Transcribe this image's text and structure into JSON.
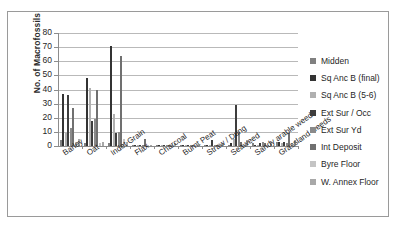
{
  "chart_data": {
    "type": "bar",
    "title": "",
    "xlabel": "",
    "ylabel": "No. of Macrofossils",
    "ylim": [
      0,
      80
    ],
    "ytick_step": 10,
    "yticks": [
      "80",
      "70",
      "60",
      "50",
      "40",
      "30",
      "20",
      "10",
      "0"
    ],
    "grid": true,
    "legend_position": "right",
    "categories": [
      "Barley",
      "Oat",
      "Indet Grain",
      "Flax",
      "Charcoal",
      "Burnt Peat",
      "Straw / Dung",
      "Seaweed",
      "Sandy arable weeds",
      "Grassland weeds"
    ],
    "series": [
      {
        "name": "Midden",
        "color": "#808080",
        "values": [
          4,
          2,
          2,
          0,
          0,
          1,
          0,
          1,
          2,
          3
        ]
      },
      {
        "name": "Sq Anc B (final)",
        "color": "#333333",
        "values": [
          37,
          48,
          71,
          1,
          1,
          0,
          1,
          2,
          1,
          3
        ]
      },
      {
        "name": "Sq Anc B (5-6)",
        "color": "#b0b0b0",
        "values": [
          9,
          41,
          23,
          1,
          0,
          0,
          1,
          5,
          1,
          2
        ]
      },
      {
        "name": "Ext Sur / Occ",
        "color": "#3d3d3d",
        "values": [
          36,
          18,
          9,
          1,
          0,
          0,
          4,
          29,
          2,
          3
        ]
      },
      {
        "name": "Ext Sur Yd",
        "color": "#8a8a8a",
        "values": [
          13,
          19,
          10,
          0,
          1,
          1,
          1,
          10,
          3,
          2
        ]
      },
      {
        "name": "Int Deposit",
        "color": "#707070",
        "values": [
          27,
          40,
          64,
          5,
          1,
          1,
          1,
          3,
          2,
          9
        ]
      },
      {
        "name": "Byre Floor",
        "color": "#c4c4c4",
        "values": [
          3,
          2,
          5,
          1,
          0,
          0,
          1,
          1,
          1,
          2
        ]
      },
      {
        "name": "W. Annex Floor",
        "color": "#a8a8a8",
        "values": [
          5,
          3,
          3,
          1,
          2,
          1,
          2,
          4,
          3,
          4
        ]
      }
    ]
  },
  "legend": {
    "items": [
      {
        "label": "Midden"
      },
      {
        "label": "Sq Anc B (final)"
      },
      {
        "label": "Sq Anc B (5-6)"
      },
      {
        "label": "Ext Sur / Occ"
      },
      {
        "label": "Ext Sur Yd"
      },
      {
        "label": "Int Deposit"
      },
      {
        "label": "Byre Floor"
      },
      {
        "label": "W. Annex Floor"
      }
    ]
  }
}
